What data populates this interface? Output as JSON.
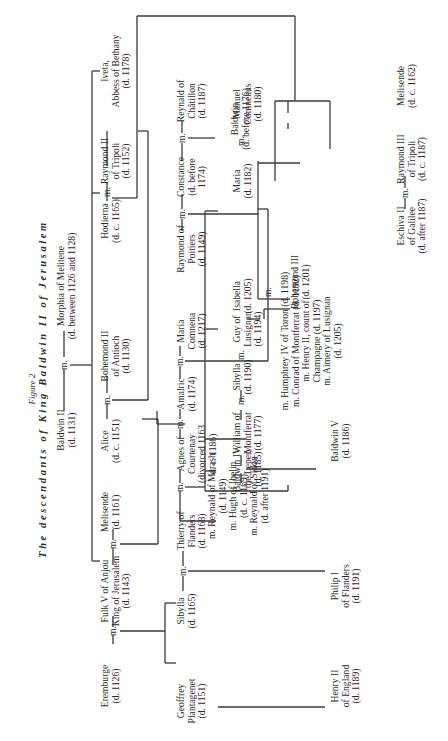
{
  "figure": {
    "label": "Figure 2",
    "title": "The descendants of King Baldwin II of Jerusalem"
  },
  "marriage_marker": "m.",
  "people": {
    "baldwin_ii": "Baldwin II\n(d. 1131)",
    "morphia": "Morphia of Melitene\n(d. between 1126 and 1128)",
    "eremburge": "Eremburge\n(d. 1126)",
    "fulk_v": "Fulk V of Anjou\nKing of Jerusalem\n(d. 1143)",
    "melisende": "Melisende\n(d. 1161)",
    "alice": "Alice\n(d. c. 1151)",
    "bohemond_ii": "Bohemond II\nof Antioch\n(d. 1130)",
    "hodierna": "Hodierna\n(d. c. 1165)",
    "raymond_ii": "Raymond II\nof Tripoli\n(d. 1152)",
    "iveta": "Iveta,\nAbbess of Bethany\n(d. 1178)",
    "geoffrey": "Geoffrey\nPlantagenet\n(d. 1151)",
    "sibylla_1165": "Sibylla\n(d. 1165)",
    "thierry": "Thierry of\nFlanders\n(d. 1168)",
    "agnes": "Agnes of\nCourtenay\n(divorced 1163\nd. c. 1186)",
    "agnes_marriages": "m. Reynald of Marash\n(d. 1149)\nm. Hugh of Ibelin\n(d. c. 1169)\nm. Reynald of Sidon\n(d. after 1191)",
    "amalric": "Amalric\n(d. 1174)",
    "maria_comnena": "Maria\nComnena\n(d. 1217)",
    "raymond_poitiers": "Raymond of\nPoitiers\n(d. 1149)",
    "constance": "Constance\n(d. before\n1174)",
    "reynald_chatillon": "Reynald of\nChâtillon\n(d. 1187)",
    "baldwin_1176": "Baldwin\n(d. before 1176)",
    "henry_ii": "Henry II\nof England\n(d. 1189)",
    "philip_i": "Philip I\nof Flanders\n(d. 1191)",
    "baldwin_iv": "Baldwin IV,\nthe Leper,\n(d. 1185)",
    "william_montferrat": "William of\nMontferrat\n(d. 1177)",
    "sibylla_1190": "Sibylla\n(d. 1190)",
    "guy_lusignan": "Guy of\nLusignan\n(d. 1194)",
    "isabella": "Isabella\n(d. 1205)",
    "isabella_marriages": "m. Humphrey IV of Toron (d. 1198)\nm. Conrad of Montferrat (d. 1192)\nm. Henry II, count of\nChampagne (d. 1197)\nm. Aimery of Lusignan\n(d. 1205)",
    "baldwin_v": "Baldwin V\n(d. 1186)",
    "bohemond_iii": "Bohemond III\n(d. 1201)",
    "maria_1182": "Maria\n(d. 1182)",
    "manuel": "Manuel\nComnenus\n(d. 1180)",
    "eschiva": "Eschiva II\nof Galilee\n(d. after 1187)",
    "raymond_iii": "Raymond III\nof Tripoli\n(d. c. 1187)",
    "melisende_1162": "Melisende\n(d. c. 1162)"
  }
}
